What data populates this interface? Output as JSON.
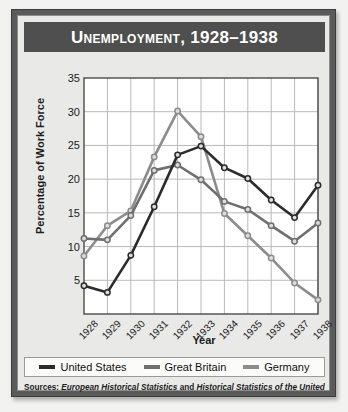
{
  "figure": {
    "title": "Unemployment, 1928–1938",
    "frame_color": "#595a59",
    "banner_color": "#4e4f4e",
    "panel_color": "#e9e9e7"
  },
  "sources": {
    "label": "Sources:",
    "source_1": "European Historical Statistics",
    "conjunction": "and",
    "source_2": "Historical Statistics of the United States"
  },
  "legend": {
    "position": "bottom",
    "items": [
      {
        "label": "United States",
        "color": "#2b2b2b"
      },
      {
        "label": "Great Britain",
        "color": "#6e6f6e"
      },
      {
        "label": "Germany",
        "color": "#8b8c8b"
      }
    ]
  },
  "chart_data": {
    "type": "line",
    "title": "Unemployment, 1928–1938",
    "xlabel": "Year",
    "ylabel": "Percentage of Work Force",
    "categories": [
      "1928",
      "1929",
      "1930",
      "1931",
      "1932",
      "1933",
      "1934",
      "1935",
      "1936",
      "1937",
      "1938"
    ],
    "x": [
      1928,
      1929,
      1930,
      1931,
      1932,
      1933,
      1934,
      1935,
      1936,
      1937,
      1938
    ],
    "ylim": [
      0,
      35
    ],
    "xlim": [
      1928,
      1938
    ],
    "yticks": [
      5,
      10,
      15,
      20,
      25,
      30,
      35
    ],
    "grid": true,
    "series": [
      {
        "name": "United States",
        "color": "#2b2b2b",
        "values": [
          4.2,
          3.2,
          8.7,
          15.9,
          23.6,
          24.9,
          21.7,
          20.1,
          16.9,
          14.3,
          19.1
        ]
      },
      {
        "name": "Great Britain",
        "color": "#6e6f6e",
        "values": [
          11.2,
          11.0,
          14.6,
          21.3,
          22.1,
          19.9,
          16.7,
          15.5,
          13.1,
          10.8,
          13.5
        ]
      },
      {
        "name": "Germany",
        "color": "#8b8c8b",
        "values": [
          8.6,
          13.1,
          15.3,
          23.3,
          30.1,
          26.3,
          14.9,
          11.6,
          8.3,
          4.6,
          2.1
        ]
      }
    ]
  }
}
